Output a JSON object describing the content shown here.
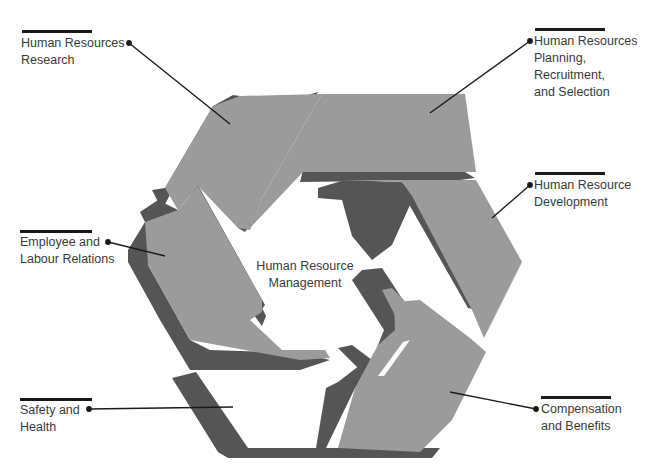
{
  "diagram": {
    "title": "Human Resource\nManagement",
    "colors": {
      "face": "#9b9b9b",
      "shadow": "#555555",
      "leader": "#1a1a1a",
      "text": "#3a3a3a",
      "background": "#ffffff"
    },
    "segments": [
      {
        "id": "hr-research",
        "label": "Human Resources\nResearch"
      },
      {
        "id": "hr-planning",
        "label": "Human Resources\nPlanning,\nRecruitment,\nand Selection"
      },
      {
        "id": "hr-development",
        "label": "Human Resource\nDevelopment"
      },
      {
        "id": "employee-labour-relations",
        "label": "Employee and\nLabour Relations"
      },
      {
        "id": "safety-health",
        "label": "Safety and\nHealth"
      },
      {
        "id": "compensation-benefits",
        "label": "Compensation\nand Benefits"
      }
    ]
  }
}
